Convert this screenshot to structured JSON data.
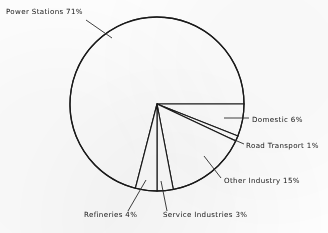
{
  "chart_data": {
    "type": "pie",
    "title": "",
    "subtitle": "",
    "xlabel": "",
    "ylabel": "",
    "grid": false,
    "legend_position": "none",
    "labels_placement": "outside-with-leader-lines",
    "total_percent": 100,
    "units": "%",
    "start_angle_deg": 0,
    "direction": "clockwise",
    "categories": [
      "Power Stations",
      "Domestic",
      "Road Transport",
      "Other Industry",
      "Service Industries",
      "Refineries"
    ],
    "values": [
      71,
      6,
      1,
      15,
      3,
      4
    ],
    "slices": [
      {
        "name": "Power Stations",
        "value": 71,
        "label": "Power  Stations 71%",
        "label_x": 6,
        "label_y": 14,
        "anchor": "start",
        "leader": "M 86,20 L 112,38"
      },
      {
        "name": "Domestic",
        "value": 6,
        "label": "Domestic  6%",
        "label_x": 252,
        "label_y": 122,
        "anchor": "start",
        "leader": "M 224,118 L 249,118"
      },
      {
        "name": "Road Transport",
        "value": 1,
        "label": "Road  Transport  1%",
        "label_x": 246,
        "label_y": 148,
        "anchor": "start",
        "leader": "M 230,138 L 244,144"
      },
      {
        "name": "Other Industry",
        "value": 15,
        "label": "Other  Industry  15%",
        "label_x": 224,
        "label_y": 183,
        "anchor": "start",
        "leader": "M 204,156 L 221,178"
      },
      {
        "name": "Service Industries",
        "value": 3,
        "label": "Service  Industries   3%",
        "label_x": 163,
        "label_y": 217,
        "anchor": "start",
        "leader": "M 161,181 L 167,211"
      },
      {
        "name": "Refineries",
        "value": 4,
        "label": "Refineries  4%",
        "label_x": 84,
        "label_y": 217,
        "anchor": "start",
        "leader": "M 146,180 L 128,211"
      }
    ]
  },
  "colors": {
    "background": "#fdfdfd",
    "stroke": "#1a1a1a",
    "text": "#161616"
  }
}
